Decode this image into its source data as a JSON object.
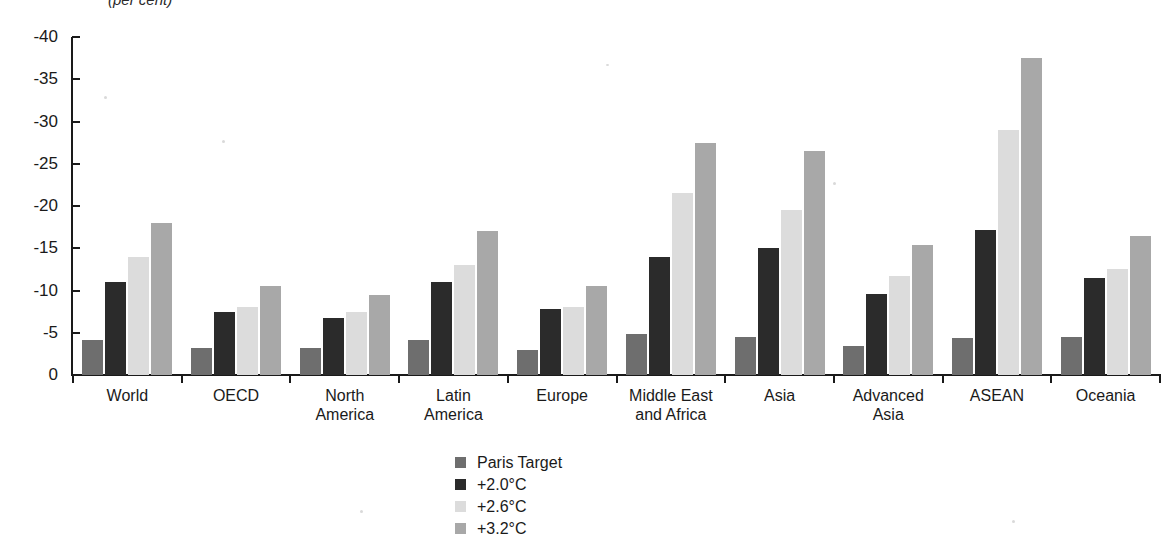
{
  "chart_data": {
    "type": "bar",
    "title": "",
    "subtitle": "",
    "unit_label": "(per cent)",
    "xlabel": "",
    "ylabel": "",
    "ylim": [
      0,
      -40
    ],
    "y_inverted": true,
    "grid": false,
    "legend_position": "bottom-center",
    "y_ticks": [
      "-40",
      "-35",
      "-30",
      "-25",
      "-20",
      "-15",
      "-10",
      "-5",
      "0"
    ],
    "y_tick_values": [
      -40,
      -35,
      -30,
      -25,
      -20,
      -15,
      -10,
      -5,
      0
    ],
    "categories": [
      "World",
      "OECD",
      "North America",
      "Latin America",
      "Europe",
      "Middle East and Africa",
      "Asia",
      "Advanced Asia",
      "ASEAN",
      "Oceania"
    ],
    "category_lines": [
      [
        "World"
      ],
      [
        "OECD"
      ],
      [
        "North",
        "America"
      ],
      [
        "Latin",
        "America"
      ],
      [
        "Europe"
      ],
      [
        "Middle East",
        "and Africa"
      ],
      [
        "Asia"
      ],
      [
        "Advanced",
        "Asia"
      ],
      [
        "ASEAN"
      ],
      [
        "Oceania"
      ]
    ],
    "series": [
      {
        "name": "Paris Target",
        "color": "#6e6e6e",
        "values": [
          -4.2,
          -3.2,
          -3.2,
          -4.2,
          -3.0,
          -4.8,
          -4.5,
          -3.4,
          -4.4,
          -4.5
        ]
      },
      {
        "name": "+2.0°C",
        "color": "#2b2b2b",
        "values": [
          -11.0,
          -7.5,
          -6.8,
          -11.0,
          -7.8,
          -14.0,
          -15.0,
          -9.6,
          -17.2,
          -11.5
        ]
      },
      {
        "name": "+2.6°C",
        "color": "#dcdcdc",
        "values": [
          -14.0,
          -8.0,
          -7.4,
          -13.0,
          -8.0,
          -21.5,
          -19.5,
          -11.7,
          -29.0,
          -12.5
        ]
      },
      {
        "name": "+3.2°C",
        "color": "#a8a8a8",
        "values": [
          -18.0,
          -10.5,
          -9.5,
          -17.0,
          -10.5,
          -27.5,
          -26.5,
          -15.4,
          -37.5,
          -16.5
        ]
      }
    ]
  },
  "legend": {
    "items": [
      {
        "label": "Paris Target",
        "color": "#6e6e6e"
      },
      {
        "label": "+2.0°C",
        "color": "#2b2b2b"
      },
      {
        "label": "+2.6°C",
        "color": "#dcdcdc"
      },
      {
        "label": "+3.2°C",
        "color": "#a8a8a8"
      }
    ]
  }
}
